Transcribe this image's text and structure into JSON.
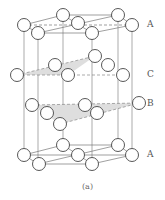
{
  "figure": {
    "caption": "(a)",
    "layers": [
      {
        "label": "A",
        "y": 25
      },
      {
        "label": "C",
        "y": 75
      },
      {
        "label": "B",
        "y": 104
      },
      {
        "label": "A",
        "y": 155
      }
    ]
  },
  "colors": {
    "atom_stroke": "#444444",
    "atom_fill": "#ffffff",
    "line": "#777777",
    "shade": "#dddddd",
    "label": "#555555"
  }
}
